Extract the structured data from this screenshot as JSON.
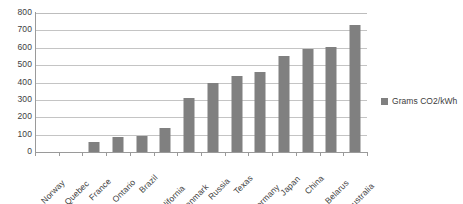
{
  "chart_data": {
    "type": "bar",
    "title": "",
    "xlabel": "",
    "ylabel": "",
    "ylim": [
      0,
      800
    ],
    "yticks": [
      800,
      700,
      600,
      500,
      400,
      300,
      200,
      100,
      0
    ],
    "grid": true,
    "legend_position": "right",
    "categories": [
      "Norway",
      "Quebec",
      "France",
      "Ontario",
      "Brazil",
      "California",
      "Denmark",
      "Russia",
      "Texas",
      "Germany",
      "Japan",
      "China",
      "Belarus",
      "Australia"
    ],
    "series": [
      {
        "name": "Grams CO2/kWh",
        "color": "#808080",
        "values": [
          0,
          0,
          60,
          85,
          90,
          140,
          310,
          400,
          440,
          460,
          550,
          595,
          605,
          730
        ]
      }
    ]
  },
  "legend": {
    "entries": [
      {
        "label": "Grams CO2/kWh",
        "color": "#808080",
        "marker": "square-marker"
      }
    ]
  },
  "axis": {
    "y_tick_labels": [
      "800",
      "700",
      "600",
      "500",
      "400",
      "300",
      "200",
      "100",
      "0"
    ],
    "x_tick_labels": [
      "Norway",
      "Quebec",
      "France",
      "Ontario",
      "Brazil",
      "California",
      "Denmark",
      "Russia",
      "Texas",
      "Germany",
      "Japan",
      "China",
      "Belarus",
      "Australia"
    ]
  },
  "colors": {
    "bar": "#808080",
    "gridline": "#c4c4c4",
    "axis": "#9a9a9a",
    "text": "#3d3d3d",
    "background": "#ffffff"
  }
}
